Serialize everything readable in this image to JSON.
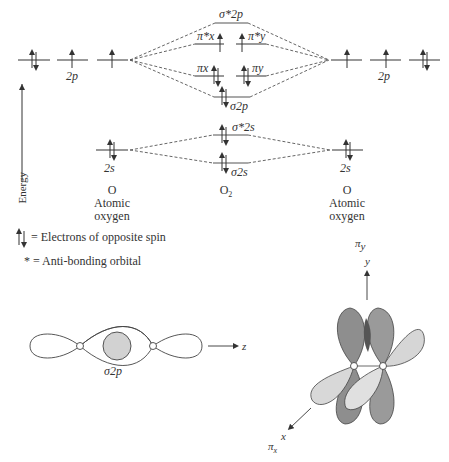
{
  "figure": {
    "type": "molecular-orbital-diagram",
    "molecule": "O2"
  },
  "axis": {
    "energy_label": "Energy"
  },
  "columns": {
    "left": {
      "symbol": "O",
      "name_line1": "Atomic",
      "name_line2": "oxygen"
    },
    "center": {
      "symbol": "O",
      "subscript": "2"
    },
    "right": {
      "symbol": "O",
      "name_line1": "Atomic",
      "name_line2": "oxygen"
    }
  },
  "atomic_orbitals": {
    "left_2p": {
      "label": "2p",
      "electrons": [
        2,
        1,
        1
      ]
    },
    "right_2p": {
      "label": "2p",
      "electrons": [
        1,
        1,
        2
      ]
    },
    "left_2s": {
      "label": "2s",
      "electrons": 2
    },
    "right_2s": {
      "label": "2s",
      "electrons": 2
    }
  },
  "molecular_orbitals": [
    {
      "id": "sigma_star_2p",
      "label": "σ*2p",
      "electrons": 0
    },
    {
      "id": "pi_star_x",
      "label": "π*x",
      "electrons": 1
    },
    {
      "id": "pi_star_y",
      "label": "π*y",
      "electrons": 1
    },
    {
      "id": "pi_x",
      "label": "πx",
      "electrons": 2
    },
    {
      "id": "pi_y",
      "label": "πy",
      "electrons": 2
    },
    {
      "id": "sigma_2p",
      "label": "σ2p",
      "electrons": 2
    },
    {
      "id": "sigma_star_2s",
      "label": "σ*2s",
      "electrons": 2
    },
    {
      "id": "sigma_2s",
      "label": "σ2s",
      "electrons": 2
    }
  ],
  "legend": {
    "spin_text": "= Electrons of opposite spin",
    "antibonding_text": "* = Anti-bonding orbital"
  },
  "sigma_figure": {
    "caption": "σ2p",
    "axis_label": "z"
  },
  "pi_figure": {
    "y_axis_label": "y",
    "y_orbital_label": "π",
    "y_orbital_sub": "y",
    "x_axis_label": "x",
    "x_orbital_label": "π",
    "x_orbital_sub": "x"
  },
  "colors": {
    "line": "#555555",
    "text": "#333333",
    "lobe_dark": "#8a8a8a",
    "lobe_light": "#d4d4d4",
    "overlap": "#cfcfcf"
  }
}
